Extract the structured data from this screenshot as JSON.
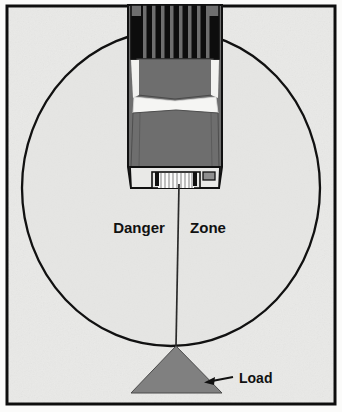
{
  "figure": {
    "background_color": "#efefed",
    "paper_color": "#ffffff",
    "border_color": "#101010",
    "frame": {
      "x": 6,
      "y": 5,
      "width": 330,
      "height": 400
    }
  },
  "danger_zone": {
    "label_left": "Danger",
    "label_right": "Zone",
    "circle": {
      "center_x": 171,
      "center_y": 188,
      "radius_x": 149,
      "radius_y": 158,
      "stroke_color": "#111111",
      "stroke_width": 2.2,
      "fill_color": "#e4e4e2"
    },
    "label_left_pos": {
      "x": 139,
      "y": 232
    },
    "label_right_pos": {
      "x": 202,
      "y": 232
    },
    "label_font_size": 15
  },
  "vehicle": {
    "name": "mobile-crane-truck",
    "body_color": "#6e6e6e",
    "grille_color": "#0d0d0d",
    "grille_bar_color": "#6e6e6e",
    "grille_bar_count": 8,
    "windshield_color": "#f4f4f2",
    "bumper_color": "#e8e8e6",
    "outline_color": "#111111",
    "left_edge": 128,
    "right_edge": 222,
    "top_edge": 5,
    "bottom_edge": 188
  },
  "cable": {
    "name": "hoist-cable",
    "color": "#2a2a2a",
    "width": 1.6,
    "top_x": 179,
    "top_y": 186,
    "bottom_x": 176,
    "bottom_y": 346
  },
  "winch": {
    "name": "winch-drum",
    "color": "#ffffff",
    "stripe_color": "#8a8a8a",
    "stripe_count": 9
  },
  "load": {
    "label": "Load",
    "shape": "triangle",
    "fill_color": "#808080",
    "stroke_color": "#3a3a3a",
    "apex_x": 176,
    "apex_y": 346,
    "left_x": 131,
    "right_x": 222,
    "base_y": 393,
    "label_pos": {
      "x": 236,
      "y": 382
    },
    "label_font_size": 14,
    "arrow": {
      "name": "load-pointer-arrow",
      "from_x": 232,
      "from_y": 377,
      "to_x": 207,
      "to_y": 381,
      "color": "#111111"
    }
  }
}
